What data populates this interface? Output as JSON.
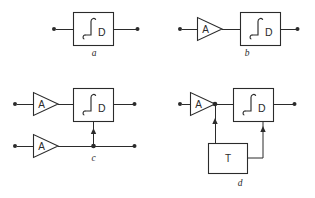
{
  "figure": {
    "background_color": "#ffffff",
    "line_color": "#2b2b2b",
    "width": 315,
    "height": 198
  },
  "panels": [
    {
      "id": "a",
      "caption": "a",
      "description": "Integrator block alone with input and output terminals",
      "blocks": [
        {
          "kind": "integrator",
          "symbol": "∫",
          "subscript": "D",
          "label": "∫D"
        }
      ],
      "terminals": [
        "input",
        "output"
      ]
    },
    {
      "id": "b",
      "caption": "b",
      "description": "Amplifier A feeding an integrator block",
      "blocks": [
        {
          "kind": "amplifier",
          "label": "A"
        },
        {
          "kind": "integrator",
          "symbol": "∫",
          "subscript": "D",
          "label": "∫D"
        }
      ],
      "terminals": [
        "input",
        "output"
      ]
    },
    {
      "id": "c",
      "caption": "c",
      "description": "Two amplifiers; lower branch feeds the integrator control input from a junction",
      "blocks": [
        {
          "kind": "amplifier",
          "label": "A"
        },
        {
          "kind": "integrator",
          "symbol": "∫",
          "subscript": "D",
          "label": "∫D"
        },
        {
          "kind": "amplifier",
          "label": "A"
        }
      ],
      "terminals": [
        "input-top",
        "output-top",
        "input-bottom",
        "output-bottom"
      ],
      "junction_label": "c"
    },
    {
      "id": "d",
      "caption": "d",
      "description": "Amplifier A into integrator with T block feedback loop",
      "blocks": [
        {
          "kind": "amplifier",
          "label": "A"
        },
        {
          "kind": "integrator",
          "symbol": "∫",
          "subscript": "D",
          "label": "∫D"
        },
        {
          "kind": "transfer",
          "label": "T"
        }
      ],
      "terminals": [
        "input",
        "output"
      ]
    }
  ],
  "labels": {
    "amplifier": "A",
    "integrator_subscript": "D",
    "integrator_symbol": "∫",
    "transfer": "T",
    "caption_a": "a",
    "caption_b": "b",
    "caption_c": "c",
    "caption_d": "d"
  }
}
